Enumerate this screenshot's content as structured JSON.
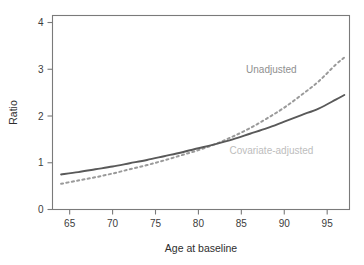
{
  "chart_data": {
    "type": "line",
    "title": "",
    "subtitle": "",
    "xlabel": "Age at baseline",
    "ylabel": "Ratio",
    "xlim": [
      63.0,
      97.6
    ],
    "ylim": [
      0,
      4.15
    ],
    "xticks": [
      65,
      70,
      75,
      80,
      85,
      90,
      95
    ],
    "yticks": [
      0,
      1,
      2,
      3,
      4
    ],
    "xtick_labels": [
      "65",
      "70",
      "75",
      "80",
      "85",
      "90",
      "95"
    ],
    "ytick_labels": [
      "0",
      "1",
      "2",
      "3",
      "4"
    ],
    "grid": false,
    "legend_position": "inline-annotations",
    "x": [
      64,
      66,
      68,
      70,
      72,
      74,
      76,
      78,
      80,
      82,
      84,
      86,
      88,
      90,
      92,
      94,
      96,
      97
    ],
    "series": [
      {
        "name": "Unadjusted",
        "style": "dashed",
        "color": "#9a9a9a",
        "values": [
          0.55,
          0.62,
          0.69,
          0.77,
          0.86,
          0.95,
          1.05,
          1.16,
          1.27,
          1.4,
          1.56,
          1.74,
          1.95,
          2.18,
          2.45,
          2.74,
          3.1,
          3.25
        ]
      },
      {
        "name": "Covariate-adjusted",
        "style": "solid",
        "color": "#595959",
        "values": [
          0.75,
          0.8,
          0.86,
          0.92,
          0.99,
          1.06,
          1.14,
          1.22,
          1.31,
          1.4,
          1.5,
          1.62,
          1.74,
          1.88,
          2.02,
          2.16,
          2.35,
          2.45
        ]
      }
    ],
    "annotations": [
      {
        "text": "Unadjusted",
        "x": 88.5,
        "y": 2.92,
        "color": "#8f8f8f",
        "anchor": "middle"
      },
      {
        "text": "Covariate-adjusted",
        "x": 88.5,
        "y": 1.18,
        "color": "#bdbdbd",
        "anchor": "middle"
      }
    ]
  },
  "axes": {
    "x_title": "Age at baseline",
    "y_title": "Ratio"
  },
  "colors": {
    "axis": "#7a7a7a",
    "tick_text": "#3c3c3c",
    "unadjusted_line": "#9a9a9a",
    "covariate_adjusted_line": "#595959",
    "unadjusted_label": "#8f8f8f",
    "covariate_adjusted_label": "#bdbdbd",
    "background": "#ffffff"
  }
}
